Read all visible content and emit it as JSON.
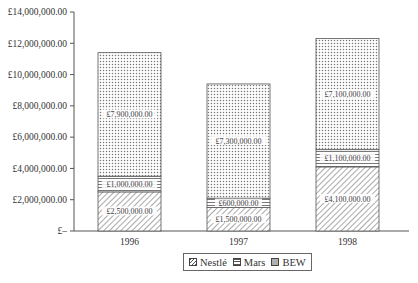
{
  "chart_data": {
    "type": "bar",
    "stacked": true,
    "title": "",
    "xlabel": "",
    "ylabel": "",
    "categories": [
      "1996",
      "1997",
      "1998"
    ],
    "series": [
      {
        "name": "Nestlé",
        "values": [
          2500000,
          1500000,
          4100000
        ],
        "labels": [
          "£2,500,000.00",
          "£1,500,000.00",
          "£4,100,000.00"
        ],
        "pattern": "diagonal-hatch"
      },
      {
        "name": "Mars",
        "values": [
          1000000,
          600000,
          1100000
        ],
        "labels": [
          "£1,000,000.00",
          "£600,000.00",
          "£1,100,000.00"
        ],
        "pattern": "horizontal-lines"
      },
      {
        "name": "BEW",
        "values": [
          7900000,
          7300000,
          7100000
        ],
        "labels": [
          "£7,900,000.00",
          "£7,300,000.00",
          "£7,100,000.00"
        ],
        "pattern": "dots"
      }
    ],
    "ylim": [
      0,
      14000000
    ],
    "yticks": [
      "£–",
      "£2,000,000.00",
      "£4,000,000.00",
      "£6,000,000.00",
      "£8,000,000.00",
      "£10,000,000.00",
      "£12,000,000.00",
      "£14,000,000.00"
    ],
    "grid": false,
    "legend_position": "bottom"
  },
  "legend": {
    "items": [
      {
        "label": "Nestlé"
      },
      {
        "label": "Mars"
      },
      {
        "label": "BEW"
      }
    ]
  }
}
